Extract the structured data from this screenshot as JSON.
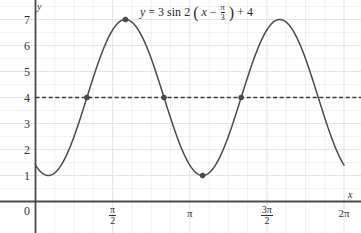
{
  "chart_data": {
    "type": "line",
    "equation": {
      "lhs": "y",
      "eq": "=",
      "amplitude": "3",
      "func": "sin",
      "b": "2",
      "open_paren": "(",
      "var": "x",
      "minus": "−",
      "phase_num": "π",
      "phase_den": "3",
      "close_paren": ")",
      "plus": "+",
      "vertical_shift": "4"
    },
    "xlabel": "x",
    "ylabel": "y",
    "xlim": [
      0,
      6.2832
    ],
    "ylim": [
      0,
      7.6
    ],
    "grid": true,
    "gridcolor": "#e3e3e8",
    "curve_color": "#4a4a4a",
    "midline": {
      "value": 4,
      "style": "dashed",
      "color": "#3a3a3a"
    },
    "xticks": [
      {
        "value": 1.5708,
        "label_num": "π",
        "label_den": "2",
        "fraction": true
      },
      {
        "value": 3.1416,
        "label_num": "π",
        "label_den": "",
        "fraction": false
      },
      {
        "value": 4.7124,
        "label_num": "3π",
        "label_den": "2",
        "fraction": true
      },
      {
        "value": 6.2832,
        "label_num": "2π",
        "label_den": "",
        "fraction": false
      }
    ],
    "yticks": [
      {
        "value": 0,
        "label": "0"
      },
      {
        "value": 1,
        "label": "1"
      },
      {
        "value": 2,
        "label": "2"
      },
      {
        "value": 3,
        "label": "3"
      },
      {
        "value": 4,
        "label": "4"
      },
      {
        "value": 5,
        "label": "5"
      },
      {
        "value": 6,
        "label": "6"
      },
      {
        "value": 7,
        "label": "7"
      }
    ],
    "origin_label": "0",
    "marked_points": [
      {
        "x": 1.0472,
        "y": 4,
        "kind": "midline-crossing-rising"
      },
      {
        "x": 1.8326,
        "y": 7,
        "kind": "maximum"
      },
      {
        "x": 2.618,
        "y": 4,
        "kind": "midline-crossing-falling"
      },
      {
        "x": 3.4034,
        "y": 1,
        "kind": "minimum"
      },
      {
        "x": 4.1888,
        "y": 4,
        "kind": "midline-crossing-rising"
      }
    ],
    "series": [
      {
        "name": "y = 3 sin 2(x - pi/3) + 4",
        "amplitude": 3,
        "period": 3.1416,
        "phase_shift": 1.0472,
        "vertical_shift": 4,
        "x_start": 0.0,
        "x_end": 6.2832,
        "y_at_x_start": 1.0,
        "y_at_x_end": 1.0,
        "maxima_x": [
          1.8326,
          4.9742
        ],
        "minima_x": [
          0.2618,
          3.4034,
          6.2832
        ]
      }
    ]
  }
}
